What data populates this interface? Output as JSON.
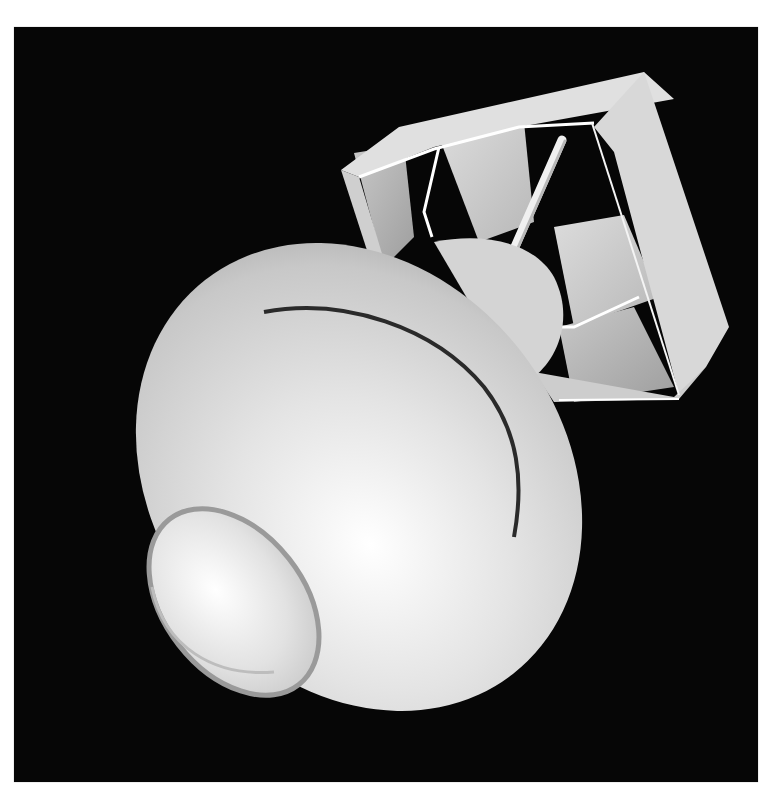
{
  "scene": {
    "subject": "3D render of a bomb with box tail fin",
    "background_color": "#060606",
    "frame_color": "#ffffff",
    "body_color": "#e6e6e6",
    "shadow_color": "#9a9a9a",
    "seam_color": "#2a2a2a"
  }
}
